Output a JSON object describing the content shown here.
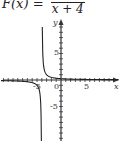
{
  "title": {
    "lhs": "F(x) =",
    "numerator": "",
    "denominator": "x + 4"
  },
  "chart_data": {
    "type": "line",
    "function": "1/(x+4)",
    "xlabel": "x",
    "ylabel": "y",
    "x_tick_labels": [
      "-5",
      "0",
      "5"
    ],
    "y_tick_labels": [
      "5",
      "-5"
    ],
    "xlim": [
      -12,
      12
    ],
    "ylim": [
      -11,
      11
    ],
    "vertical_asymptote": -4,
    "horizontal_asymptote": 0,
    "series": [
      {
        "name": "left branch",
        "x": [
          -12,
          -10,
          -8,
          -6,
          -5,
          -4.5,
          -4.2
        ],
        "y": [
          -0.125,
          -0.167,
          -0.25,
          -0.5,
          -1,
          -2,
          -5
        ]
      },
      {
        "name": "right branch",
        "x": [
          -3.9,
          -3.8,
          -3.5,
          -3,
          -2,
          0,
          5,
          12
        ],
        "y": [
          10,
          5,
          2,
          1,
          0.5,
          0.25,
          0.111,
          0.0625
        ]
      }
    ],
    "grid": false,
    "legend": null
  },
  "axes": {
    "x_label": "x",
    "y_label": "y",
    "x_ticks": {
      "neg": "-5",
      "zero": "0",
      "pos": "5"
    },
    "y_ticks": {
      "pos": "5",
      "neg": "-5"
    }
  },
  "colors": {
    "axis": "#333333",
    "curve": "#222222",
    "background": "#ffffff"
  }
}
